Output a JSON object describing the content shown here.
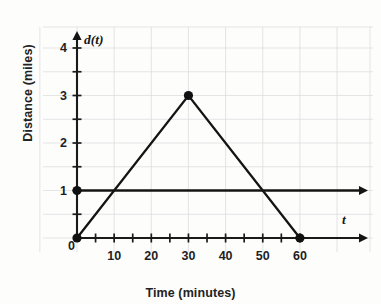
{
  "chart_data": {
    "type": "line",
    "title": "",
    "xlabel": "Time (minutes)",
    "ylabel": "Distance (miles)",
    "x_axis_name": "t",
    "y_axis_name": "d(t)",
    "xlim": [
      0,
      65
    ],
    "ylim": [
      0,
      4.35
    ],
    "xticks": [
      0,
      5,
      10,
      15,
      20,
      25,
      30,
      35,
      40,
      45,
      50,
      55,
      60
    ],
    "xtick_labels": [
      "0",
      "10",
      "20",
      "30",
      "40",
      "50",
      "60"
    ],
    "xtick_label_values": [
      0,
      10,
      20,
      30,
      40,
      50,
      60
    ],
    "yticks": [
      0,
      0.5,
      1,
      1.5,
      2,
      2.5,
      3,
      3.5,
      4
    ],
    "ytick_labels": [
      "0",
      "1",
      "2",
      "3",
      "4"
    ],
    "ytick_label_values": [
      0,
      1,
      2,
      3,
      4
    ],
    "grid": true,
    "grid_x_step": 10,
    "grid_y_step": 0.5,
    "legend": "none",
    "series": [
      {
        "name": "d(t)",
        "type": "line",
        "points": [
          [
            0,
            0
          ],
          [
            30,
            3
          ],
          [
            60,
            0
          ]
        ],
        "markers": [
          [
            0,
            0
          ],
          [
            30,
            3
          ],
          [
            60,
            0
          ]
        ],
        "arrow_end": false
      },
      {
        "name": "constant-1",
        "type": "line",
        "points": [
          [
            0,
            1
          ],
          [
            65,
            1
          ]
        ],
        "markers": [
          [
            0,
            1
          ]
        ],
        "arrow_end": true
      }
    ],
    "annotations": []
  }
}
